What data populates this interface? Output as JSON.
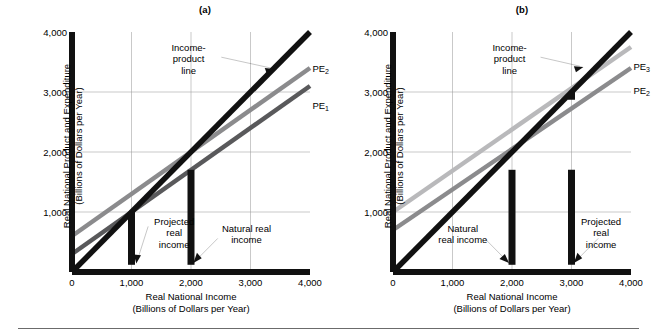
{
  "figure": {
    "axis_titles": {
      "x_line1": "Real National Income",
      "x_line2": "(Billions of Dollars per Year)",
      "y_line1": "Real National Product and Expenditure",
      "y_line2": "(Billions of Dollars per Year)"
    },
    "colors": {
      "income_product_line": "#111111",
      "pe1": "#59595b",
      "pe2": "#8b8b8d",
      "pe3": "#b9b9bb",
      "grid": "#9a9a9a",
      "axis": "#111111",
      "dashed": "#111111",
      "footer_rule": "#6b6b6b"
    }
  },
  "panels": [
    {
      "id": "a",
      "title": "(a)",
      "annotations": {
        "income_product": "Income-\nproduct\nline",
        "income_product_lines": [
          "Income-",
          "product",
          "line"
        ],
        "left_marker_lines": [
          "Projected",
          "real",
          "income"
        ],
        "right_marker_lines": [
          "Natural real",
          "income"
        ]
      },
      "curve_labels": [
        {
          "name": "PE2",
          "base": "PE",
          "sub": "2"
        },
        {
          "name": "PE1",
          "base": "PE",
          "sub": "1"
        }
      ],
      "markers": [
        {
          "label": "Projected real income",
          "x": 1000
        },
        {
          "label": "Natural real income",
          "x": 2000
        }
      ]
    },
    {
      "id": "b",
      "title": "(b)",
      "annotations": {
        "income_product": "Income-\nproduct\nline",
        "income_product_lines": [
          "Income-",
          "product",
          "line"
        ],
        "left_marker_lines": [
          "Natural",
          "real income"
        ],
        "right_marker_lines": [
          "Projected",
          "real",
          "income"
        ]
      },
      "curve_labels": [
        {
          "name": "PE3",
          "base": "PE",
          "sub": "3"
        },
        {
          "name": "PE2",
          "base": "PE",
          "sub": "2"
        }
      ],
      "markers": [
        {
          "label": "Natural real income",
          "x": 2000
        },
        {
          "label": "Projected real income",
          "x": 3000
        }
      ]
    }
  ],
  "chart_data": [
    {
      "type": "line",
      "panel": "a",
      "title": "(a)",
      "xlabel": "Real National Income (Billions of Dollars per Year)",
      "ylabel": "Real National Product and Expenditure (Billions of Dollars per Year)",
      "xlim": [
        0,
        4000
      ],
      "ylim": [
        0,
        4000
      ],
      "xticks": [
        0,
        1000,
        2000,
        3000,
        4000
      ],
      "xticklabels": [
        "0",
        "1,000",
        "2,000",
        "3,000",
        "4,000"
      ],
      "yticks": [
        1000,
        2000,
        3000,
        4000
      ],
      "yticklabels": [
        "1,000",
        "2,000",
        "3,000",
        "4,000"
      ],
      "grid": true,
      "legend": "inline-labels",
      "series": [
        {
          "name": "Income-product line",
          "color": "#111111",
          "x": [
            0,
            4000
          ],
          "values": [
            0,
            4000
          ],
          "intercept": 0,
          "slope": 1.0
        },
        {
          "name": "PE2",
          "color": "#8b8b8d",
          "x": [
            0,
            4000
          ],
          "values": [
            600,
            3400
          ],
          "intercept": 600,
          "slope": 0.7
        },
        {
          "name": "PE1",
          "color": "#59595b",
          "x": [
            0,
            4000
          ],
          "values": [
            300,
            3100
          ],
          "intercept": 300,
          "slope": 0.7
        }
      ],
      "annotations": [
        {
          "text": "Income-product line",
          "points_to_series": "Income-product line",
          "x": 3500,
          "y": 3500
        },
        {
          "text": "Projected real income",
          "x": 1000,
          "y": 1000,
          "marker": "dashed-vertical"
        },
        {
          "text": "Natural real income",
          "x": 2000,
          "y": 2000,
          "marker": "dashed-vertical"
        }
      ],
      "equilibria": [
        {
          "series": "PE1",
          "x": 1000,
          "y": 1000,
          "label": "Projected real income"
        },
        {
          "series": "PE2",
          "x": 2000,
          "y": 2000,
          "label": "Natural real income"
        }
      ]
    },
    {
      "type": "line",
      "panel": "b",
      "title": "(b)",
      "xlabel": "Real National Income (Billions of Dollars per Year)",
      "ylabel": "Real National Product and Expenditure (Billions of Dollars per Year)",
      "xlim": [
        0,
        4000
      ],
      "ylim": [
        0,
        4000
      ],
      "xticks": [
        0,
        1000,
        2000,
        3000,
        4000
      ],
      "xticklabels": [
        "0",
        "1,000",
        "2,000",
        "3,000",
        "4,000"
      ],
      "yticks": [
        1000,
        2000,
        3000,
        4000
      ],
      "yticklabels": [
        "1,000",
        "2,000",
        "3,000",
        "4,000"
      ],
      "grid": true,
      "legend": "inline-labels",
      "series": [
        {
          "name": "Income-product line",
          "color": "#111111",
          "x": [
            0,
            4000
          ],
          "values": [
            0,
            4000
          ],
          "intercept": 0,
          "slope": 1.0
        },
        {
          "name": "PE3",
          "color": "#b9b9bb",
          "x": [
            0,
            4000
          ],
          "values": [
            1000,
            3750
          ],
          "intercept": 1000,
          "slope": 0.6875
        },
        {
          "name": "PE2",
          "color": "#8b8b8d",
          "x": [
            0,
            4000
          ],
          "values": [
            700,
            3400
          ],
          "intercept": 700,
          "slope": 0.675
        }
      ],
      "annotations": [
        {
          "text": "Income-product line",
          "points_to_series": "Income-product line",
          "x": 3200,
          "y": 3200
        },
        {
          "text": "Natural real income",
          "x": 2000,
          "y": 2000,
          "marker": "dashed-vertical"
        },
        {
          "text": "Projected real income",
          "x": 3000,
          "y": 3000,
          "marker": "dashed-vertical"
        }
      ],
      "equilibria": [
        {
          "series": "PE2",
          "x": 2000,
          "y": 2000,
          "label": "Natural real income"
        },
        {
          "series": "PE3",
          "x": 3000,
          "y": 3000,
          "label": "Projected real income"
        }
      ]
    }
  ],
  "ticks": {
    "x": [
      "0",
      "1,000",
      "2,000",
      "3,000",
      "4,000"
    ],
    "y": [
      "1,000",
      "2,000",
      "3,000",
      "4,000"
    ]
  }
}
